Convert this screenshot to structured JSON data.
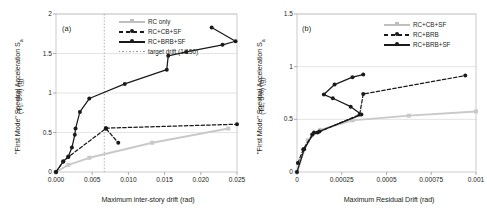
{
  "figure": {
    "panels": [
      "a",
      "b"
    ]
  },
  "panel_a": {
    "tag": "(a)",
    "ylabel_main": "\"First Mode\" Spectral Acceleration S",
    "ylabel_sub": "a",
    "ylabel_line2": "(T₁, 5%) (g)",
    "xlabel": "Maximum inter-story drift (rad)",
    "legend": [
      {
        "label": "RC only",
        "style": "solid-gray",
        "marker": "gray"
      },
      {
        "label": "RC+CB+SF",
        "style": "dashed-black",
        "marker": "black"
      },
      {
        "label": "RC+BRB+SF",
        "style": "solid-black",
        "marker": "black"
      },
      {
        "label": "target drift (1/150)",
        "style": "dotted-gray",
        "marker": "none"
      }
    ],
    "xticks": [
      "0.000",
      "0.005",
      "0.010",
      "0.015",
      "0.020",
      "0.025"
    ],
    "yticks": [
      "0",
      "0.5",
      "1",
      "1.5",
      "2"
    ]
  },
  "panel_b": {
    "tag": "(b)",
    "ylabel_main": "\"First Mode\" Spectral Acceleration S",
    "ylabel_sub": "a",
    "ylabel_line2": "(T1, 5%) (g)",
    "xlabel": "Maximum Residual Drift (rad)",
    "legend": [
      {
        "label": "RC+CB+SF",
        "style": "solid-gray",
        "marker": "gray"
      },
      {
        "label": "RC+BRB",
        "style": "dashed-black",
        "marker": "black"
      },
      {
        "label": "RC+BRB+SF",
        "style": "solid-black",
        "marker": "black"
      }
    ],
    "xticks": [
      "0",
      "0.00025",
      "0.0005",
      "0.00075",
      "0.001"
    ],
    "yticks": [
      "0",
      "0.5",
      "1",
      "1.5"
    ]
  },
  "chart_data": [
    {
      "type": "line",
      "panel": "a",
      "title": "(a)",
      "xlabel": "Maximum inter-story drift (rad)",
      "ylabel": "\"First Mode\" Spectral Acceleration Sa (T1, 5%) (g)",
      "xlim": [
        0,
        0.025
      ],
      "ylim": [
        0,
        2
      ],
      "xticks": [
        0,
        0.005,
        0.01,
        0.015,
        0.02,
        0.025
      ],
      "yticks": [
        0,
        0.5,
        1,
        1.5,
        2
      ],
      "grid": "horizontal",
      "legend_position": "top-center",
      "annotations": [
        {
          "type": "vline",
          "x": 0.00667,
          "label": "target drift (1/150)",
          "color": "#9a9a9a",
          "style": "dotted"
        }
      ],
      "series": [
        {
          "name": "RC only",
          "color": "#c9c9c9",
          "style": "solid",
          "marker": "square",
          "points": [
            [
              0.0,
              0.0
            ],
            [
              0.0017,
              0.09
            ],
            [
              0.0046,
              0.18
            ],
            [
              0.0133,
              0.37
            ],
            [
              0.0238,
              0.55
            ]
          ]
        },
        {
          "name": "RC+CB+SF",
          "color": "#1a1a1a",
          "style": "dashed",
          "marker": "circle",
          "points": [
            [
              0.0,
              0.0
            ],
            [
              0.001,
              0.13
            ],
            [
              0.0017,
              0.19
            ],
            [
              0.0069,
              0.55
            ],
            [
              0.0069,
              0.55
            ],
            [
              0.0086,
              0.37
            ]
          ]
        },
        {
          "name": "RC+CB+SF (upper branch)",
          "color": "#1a1a1a",
          "style": "dashed",
          "marker": "circle",
          "points": [
            [
              0.0069,
              0.555
            ],
            [
              0.025,
              0.605
            ]
          ]
        },
        {
          "name": "RC+BRB+SF",
          "color": "#1a1a1a",
          "style": "solid",
          "marker": "circle",
          "points": [
            [
              0.0,
              0.0
            ],
            [
              0.001,
              0.135
            ],
            [
              0.0017,
              0.195
            ],
            [
              0.0022,
              0.31
            ],
            [
              0.0026,
              0.47
            ],
            [
              0.0027,
              0.55
            ],
            [
              0.0033,
              0.76
            ],
            [
              0.0046,
              0.93
            ],
            [
              0.0095,
              1.115
            ],
            [
              0.0153,
              1.295
            ],
            [
              0.0155,
              1.47
            ],
            [
              0.018,
              1.52
            ],
            [
              0.023,
              1.61
            ],
            [
              0.0248,
              1.655
            ],
            [
              0.0215,
              1.83
            ]
          ]
        }
      ]
    },
    {
      "type": "line",
      "panel": "b",
      "title": "(b)",
      "xlabel": "Maximum Residual Drift (rad)",
      "ylabel": "\"First Mode\" Spectral Acceleration Sa (T1, 5%) (g)",
      "xlim": [
        0,
        0.001
      ],
      "ylim": [
        0,
        1.5
      ],
      "xticks": [
        0,
        0.00025,
        0.0005,
        0.00075,
        0.001
      ],
      "yticks": [
        0,
        0.5,
        1,
        1.5
      ],
      "grid": "horizontal",
      "legend_position": "top-right",
      "series": [
        {
          "name": "RC+CB+SF",
          "color": "#c9c9c9",
          "style": "solid",
          "marker": "square",
          "points": [
            [
              0.0,
              0.0
            ],
            [
              6e-05,
              0.3
            ],
            [
              0.00013,
              0.4
            ],
            [
              0.00031,
              0.49
            ],
            [
              0.000625,
              0.535
            ],
            [
              0.001,
              0.575
            ]
          ]
        },
        {
          "name": "RC+BRB",
          "color": "#1a1a1a",
          "style": "dashed",
          "marker": "circle",
          "points": [
            [
              5e-06,
              0.085
            ],
            [
              3.5e-05,
              0.215
            ],
            [
              8.5e-05,
              0.355
            ],
            [
              0.000115,
              0.375
            ],
            [
              0.00035,
              0.545
            ],
            [
              0.00037,
              0.74
            ],
            [
              0.00094,
              0.915
            ]
          ]
        },
        {
          "name": "RC+BRB+SF",
          "color": "#1a1a1a",
          "style": "solid",
          "marker": "circle",
          "points": [
            [
              0.0,
              0.0
            ],
            [
              4e-05,
              0.215
            ],
            [
              9.5e-05,
              0.375
            ],
            [
              0.000125,
              0.385
            ],
            [
              0.00036,
              0.545
            ],
            [
              0.0003,
              0.62
            ],
            [
              0.0002,
              0.7
            ],
            [
              0.00015,
              0.735
            ],
            [
              0.00021,
              0.83
            ],
            [
              0.00031,
              0.9
            ],
            [
              0.00037,
              0.925
            ]
          ]
        }
      ]
    }
  ]
}
